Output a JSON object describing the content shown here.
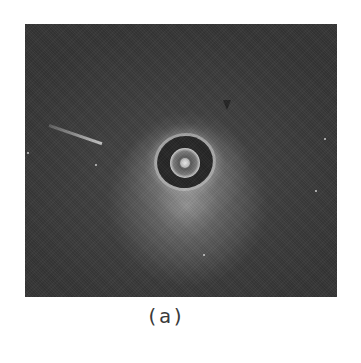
{
  "figure": {
    "panel_label": "(a)",
    "image": {
      "description": "grayscale cross-sectional intravascular image with bright ring at center",
      "background_color": "#3a3a3a",
      "halo_color": "#c8c8c8",
      "ring_color": "#d0d0d0"
    }
  }
}
